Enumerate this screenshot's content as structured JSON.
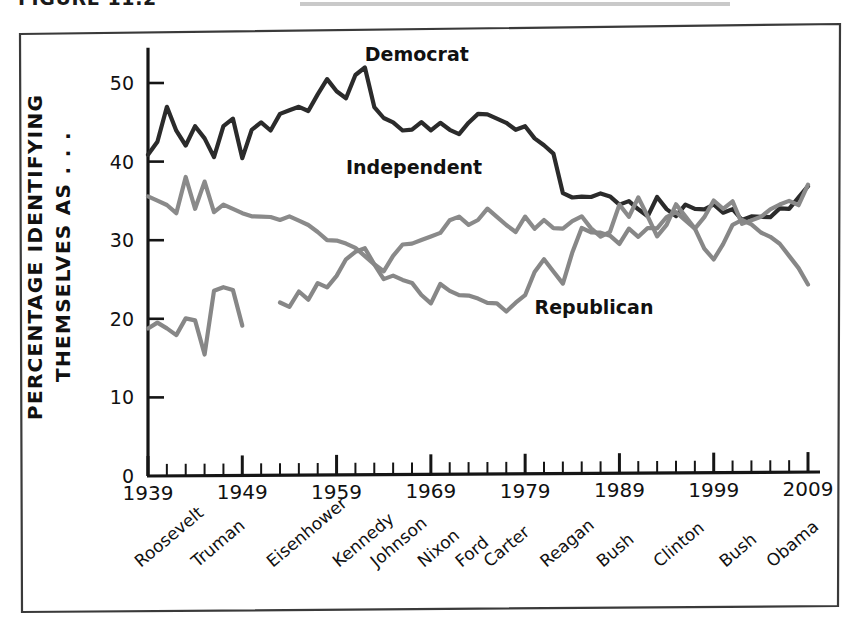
{
  "figure": {
    "caption_partial": "FIGURE 11.2",
    "caption_rule_visible": true
  },
  "chart_data": {
    "type": "line",
    "title": "",
    "subtitle": "",
    "xlabel": "",
    "ylabel": "PERCENTAGE IDENTIFYING THEMSELVES AS . . .",
    "ylabel_line1": "PERCENTAGE IDENTIFYING",
    "ylabel_line2": "THEMSELVES AS . . .",
    "xlim": [
      1937,
      2010
    ],
    "ylim": [
      0,
      55
    ],
    "y_ticks": [
      0,
      10,
      20,
      30,
      40,
      50
    ],
    "y_tick_labels": [
      "0",
      "10",
      "20",
      "30",
      "40",
      "50"
    ],
    "x_ticks": [
      1939,
      1949,
      1959,
      1969,
      1979,
      1989,
      1999,
      2009
    ],
    "x_tick_labels": [
      "1939",
      "1949",
      "1959",
      "1969",
      "1979",
      "1989",
      "1999",
      "2009"
    ],
    "x_minor_tick_interval": 2,
    "grid": false,
    "legend_position": "inline-annotations",
    "presidents": [
      {
        "name": "Roosevelt",
        "x": 1941
      },
      {
        "name": "Truman",
        "x": 1947
      },
      {
        "name": "Eisenhower",
        "x": 1955
      },
      {
        "name": "Kennedy",
        "x": 1962
      },
      {
        "name": "Johnson",
        "x": 1966
      },
      {
        "name": "Nixon",
        "x": 1971
      },
      {
        "name": "Ford",
        "x": 1975
      },
      {
        "name": "Carter",
        "x": 1978
      },
      {
        "name": "Reagan",
        "x": 1984
      },
      {
        "name": "Bush",
        "x": 1990
      },
      {
        "name": "Clinton",
        "x": 1996
      },
      {
        "name": "Bush",
        "x": 2003
      },
      {
        "name": "Obama",
        "x": 2008
      }
    ],
    "annotations": [
      {
        "text": "Democrat",
        "x": 1962,
        "y": 52.8
      },
      {
        "text": "Independent",
        "x": 1960,
        "y": 38.4
      },
      {
        "text": "Republican",
        "x": 1980,
        "y": 20.6
      }
    ],
    "series": [
      {
        "name": "Democrat",
        "color": "#2b2b2b",
        "x": [
          1939,
          1940,
          1941,
          1942,
          1943,
          1944,
          1945,
          1946,
          1947,
          1948,
          1949,
          1950,
          1951,
          1952,
          1953,
          1954,
          1955,
          1956,
          1957,
          1958,
          1959,
          1960,
          1961,
          1962,
          1963,
          1964,
          1965,
          1966,
          1967,
          1968,
          1969,
          1970,
          1971,
          1972,
          1973,
          1974,
          1975,
          1976,
          1977,
          1978,
          1979,
          1980,
          1981,
          1982,
          1983,
          1984,
          1985,
          1986,
          1987,
          1988,
          1989,
          1990,
          1991,
          1992,
          1993,
          1994,
          1995,
          1996,
          1997,
          1998,
          1999,
          2000,
          2001,
          2002,
          2003,
          2004,
          2005,
          2006,
          2007,
          2008,
          2009
        ],
        "values": [
          40.8,
          42.5,
          47.0,
          44.0,
          42.0,
          44.5,
          43.0,
          40.5,
          44.5,
          45.5,
          40.5,
          44.0,
          45.0,
          44.0,
          46.0,
          46.5,
          47.0,
          46.5,
          48.5,
          50.5,
          49.0,
          48.0,
          51.0,
          52.0,
          47.0,
          45.5,
          45.0,
          44.0,
          44.0,
          45.0,
          44.0,
          45.0,
          44.0,
          43.5,
          45.0,
          46.0,
          46.0,
          45.5,
          45.0,
          44.0,
          44.5,
          43.0,
          42.0,
          41.0,
          36.0,
          35.5,
          35.5,
          35.5,
          36.0,
          35.5,
          34.5,
          35.0,
          34.0,
          33.0,
          35.5,
          34.0,
          33.0,
          34.5,
          34.0,
          34.0,
          34.5,
          33.5,
          34.0,
          32.5,
          33.0,
          33.0,
          33.0,
          34.0,
          34.0,
          35.5,
          36.8
        ]
      },
      {
        "name": "Independent",
        "color": "#8a8a8a",
        "x": [
          1939,
          1940,
          1941,
          1942,
          1943,
          1944,
          1945,
          1946,
          1947,
          1948,
          1949,
          1950,
          1951,
          1952,
          1953,
          1954,
          1955,
          1956,
          1957,
          1958,
          1959,
          1960,
          1961,
          1962,
          1963,
          1964,
          1965,
          1966,
          1967,
          1968,
          1969,
          1970,
          1971,
          1972,
          1973,
          1974,
          1975,
          1976,
          1977,
          1978,
          1979,
          1980,
          1981,
          1982,
          1983,
          1984,
          1985,
          1986,
          1987,
          1988,
          1989,
          1990,
          1991,
          1992,
          1993,
          1994,
          1995,
          1996,
          1997,
          1998,
          1999,
          2000,
          2001,
          2002,
          2003,
          2004,
          2005,
          2006,
          2007,
          2008,
          2009
        ],
        "values": [
          35.5,
          35.0,
          34.5,
          33.5,
          38.0,
          34.0,
          37.5,
          33.5,
          34.5,
          34.0,
          33.5,
          33.0,
          33.0,
          33.0,
          32.5,
          33.0,
          32.5,
          32.0,
          31.0,
          30.0,
          30.0,
          29.5,
          29.0,
          28.0,
          27.0,
          26.0,
          28.0,
          29.5,
          29.5,
          30.0,
          30.5,
          31.0,
          32.5,
          33.0,
          32.0,
          32.5,
          34.0,
          33.0,
          32.0,
          31.0,
          33.0,
          31.5,
          32.5,
          31.5,
          31.5,
          32.5,
          33.0,
          31.5,
          30.5,
          31.0,
          34.5,
          33.0,
          35.5,
          33.0,
          30.5,
          32.0,
          34.5,
          33.0,
          31.5,
          33.0,
          35.0,
          34.0,
          35.0,
          32.0,
          32.5,
          33.0,
          34.0,
          34.5,
          35.0,
          34.5,
          37.0
        ]
      },
      {
        "name": "Republican",
        "color": "#878787",
        "segments": [
          {
            "x": [
              1939,
              1940,
              1941,
              1942,
              1943,
              1944,
              1945,
              1946,
              1947,
              1948,
              1949
            ],
            "values": [
              18.7,
              19.5,
              18.8,
              18.0,
              20.0,
              19.8,
              15.5,
              23.5,
              24.0,
              23.7,
              19.2
            ]
          },
          {
            "x": [
              1953,
              1954,
              1955,
              1956,
              1957,
              1958,
              1959,
              1960,
              1961,
              1962,
              1963,
              1964,
              1965,
              1966,
              1967,
              1968,
              1969,
              1970,
              1971,
              1972,
              1973,
              1974,
              1975,
              1976,
              1977,
              1978,
              1979,
              1980,
              1981,
              1982,
              1983,
              1984,
              1985,
              1986,
              1987,
              1988,
              1989,
              1990,
              1991,
              1992,
              1993,
              1994,
              1995,
              1996,
              1997,
              1998,
              1999,
              2000,
              2001,
              2002,
              2003,
              2004,
              2005,
              2006,
              2007,
              2008,
              2009
            ],
            "values": [
              22.0,
              21.5,
              23.5,
              22.5,
              24.5,
              24.0,
              25.5,
              27.5,
              28.5,
              29.0,
              27.0,
              25.0,
              25.5,
              25.0,
              24.5,
              23.0,
              22.0,
              24.5,
              23.5,
              23.0,
              23.0,
              22.5,
              22.0,
              22.0,
              21.0,
              22.0,
              23.0,
              26.0,
              27.5,
              26.0,
              24.5,
              28.5,
              31.5,
              31.0,
              31.0,
              30.5,
              29.5,
              31.5,
              30.5,
              31.5,
              31.5,
              33.0,
              33.5,
              32.5,
              31.5,
              29.0,
              27.5,
              29.5,
              32.0,
              32.5,
              32.0,
              31.0,
              30.5,
              29.5,
              28.0,
              26.5,
              24.3
            ]
          }
        ]
      }
    ]
  }
}
